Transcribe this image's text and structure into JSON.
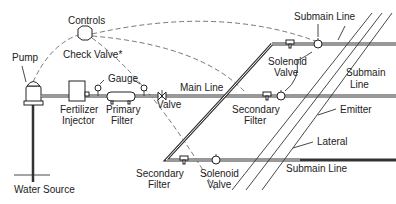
{
  "diagram": {
    "labels": {
      "controls": "Controls",
      "check_valve": "Check Valve*",
      "pump": "Pump",
      "gauge": "Gauge",
      "main_line": "Main Line",
      "fertilizer_injector_1": "Fertilizer",
      "fertilizer_injector_2": "Injector",
      "primary_filter_1": "Primary",
      "primary_filter_2": "Filter",
      "valve": "Valve",
      "water_source": "Water Source",
      "submain_line_top": "Submain Line",
      "solenoid_valve_top_1": "Solenoid",
      "solenoid_valve_top_2": "Valve",
      "submain_line_mid_1": "Submain",
      "submain_line_mid_2": "Line",
      "secondary_filter_mid_1": "Secondary",
      "secondary_filter_mid_2": "Filter",
      "emitter": "Emitter",
      "lateral": "Lateral",
      "secondary_filter_bottom_1": "Secondary",
      "secondary_filter_bottom_2": "Filter",
      "solenoid_valve_bottom_1": "Solenoid",
      "solenoid_valve_bottom_2": "Valve",
      "submain_line_bottom": "Submain Line"
    }
  }
}
